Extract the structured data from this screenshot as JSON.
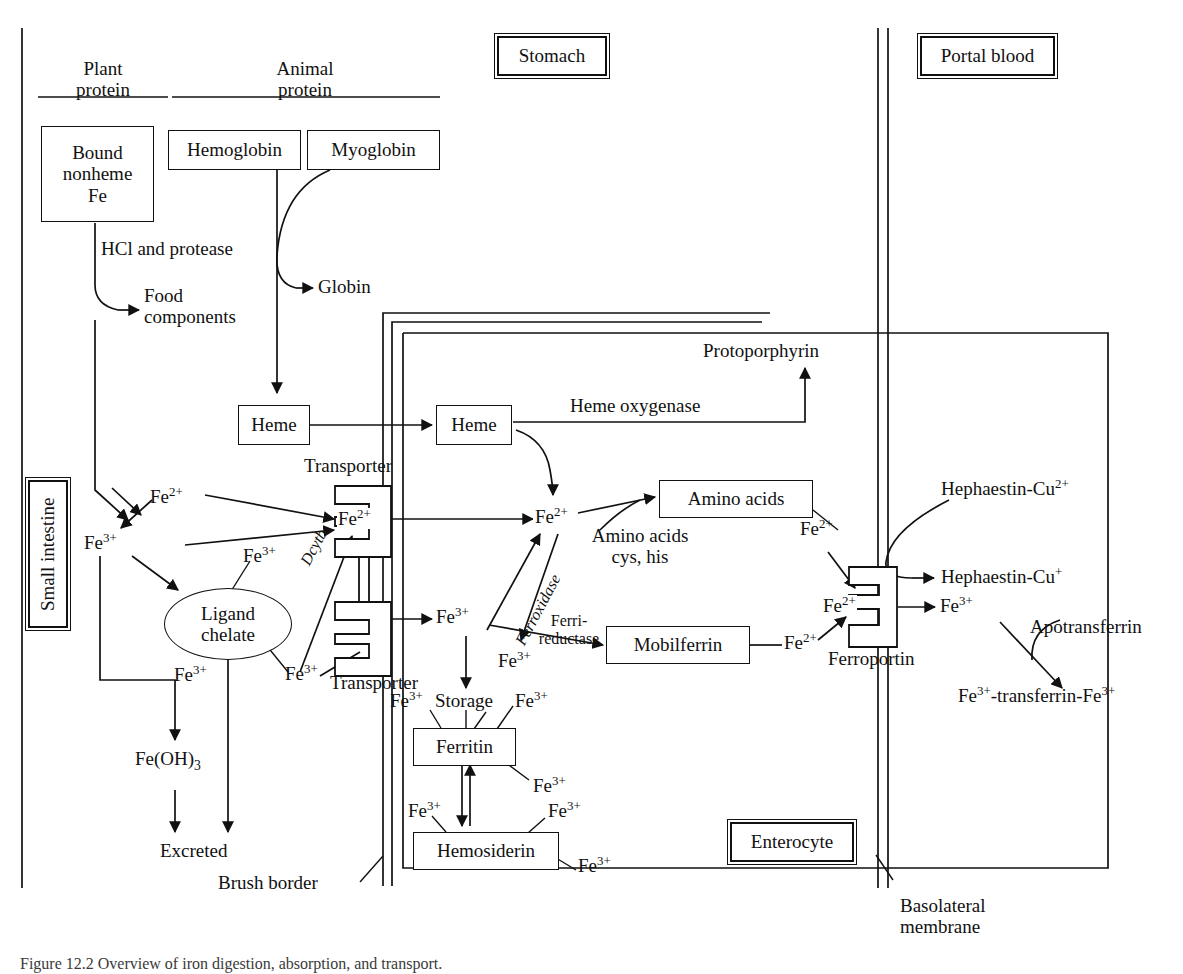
{
  "figure": {
    "caption": "Figure 12.2 Overview of iron digestion, absorption, and transport."
  },
  "compartments": {
    "stomach": "Stomach",
    "portal_blood": "Portal blood",
    "small_intestine": "Small intestine",
    "enterocyte": "Enterocyte"
  },
  "membranes": {
    "brush_border": "Brush border",
    "basolateral": "Basolateral\nmembrane",
    "basolateral_line1": "Basolateral",
    "basolateral_line2": "membrane"
  },
  "sources": {
    "plant_protein_l1": "Plant",
    "plant_protein_l2": "protein",
    "animal_protein_l1": "Animal",
    "animal_protein_l2": "protein"
  },
  "boxes": {
    "bound_nonheme_fe": "Bound\nnonheme\nFe",
    "bound_nonheme_l1": "Bound",
    "bound_nonheme_l2": "nonheme",
    "bound_nonheme_l3": "Fe",
    "hemoglobin": "Hemoglobin",
    "myoglobin": "Myoglobin",
    "heme_lumen": "Heme",
    "heme_cell": "Heme",
    "amino_acids": "Amino acids",
    "mobilferrin": "Mobilferrin",
    "ferritin": "Ferritin",
    "hemosiderin": "Hemosiderin",
    "ligand_chelate_l1": "Ligand",
    "ligand_chelate_l2": "chelate"
  },
  "labels": {
    "hcl_protease": "HCl and protease",
    "food_components_l1": "Food",
    "food_components_l2": "components",
    "globin": "Globin",
    "protoporphyrin": "Protoporphyrin",
    "heme_oxygenase": "Heme oxygenase",
    "transporter_top": "Transporter",
    "transporter_bottom": "Transporter",
    "ferroportin": "Ferroportin",
    "dcytb": "Dcytb",
    "ferroxidase": "Ferroxidase",
    "ferri_reductase_l1": "Ferri-",
    "ferri_reductase_l2": "reductase",
    "amino_acids_cys_l1": "Amino acids",
    "amino_acids_cys_l2": "cys, his",
    "storage": "Storage",
    "fe_oh_3": "Fe(OH)",
    "fe_oh_3_sub": "3",
    "excreted": "Excreted",
    "apotransferrin": "Apotransferrin",
    "hephaestin_cu2": "Hephaestin-Cu",
    "hephaestin_cu2_sup": "2+",
    "hephaestin_cu1": "Hephaestin-Cu",
    "hephaestin_cu1_sup": "+",
    "fe_transferrin_fe": "-transferrin-Fe"
  },
  "ions": {
    "fe2": "Fe",
    "fe2_sup": "2+",
    "fe3": "Fe",
    "fe3_sup": "3+",
    "lumen_fe2": "Fe2+",
    "lumen_fe3": "Fe3+",
    "chelate_fe3_top": "Fe3+",
    "chelate_fe3_bottom": "Fe3+",
    "transporter_in_fe2": "Fe2+",
    "transporter_in_fe3": "Fe3+",
    "cyto_fe2": "Fe2+",
    "cyto_fe3": "Fe3+",
    "storage_fe3_left": "Fe3+",
    "storage_fe3_right": "Fe3+",
    "ferritin_fe3": "Fe3+",
    "hemosiderin_fe3_left": "Fe3+",
    "hemosiderin_fe3_right_top": "Fe3+",
    "hemosiderin_fe3_right_bottom": "Fe3+",
    "mobilferrin_fe2": "Fe2+",
    "amino_fe2": "Fe2+",
    "ferroportin_fe2": "Fe2+",
    "exported_fe3": "Fe3+",
    "reductase_fe3": "Fe3+"
  },
  "colors": {
    "ink": "#111111",
    "paper": "#ffffff"
  }
}
